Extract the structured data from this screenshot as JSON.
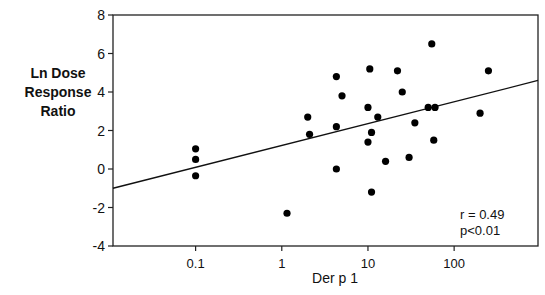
{
  "chart_data": {
    "type": "scatter",
    "title": "",
    "xlabel": "Der p 1",
    "ylabel": "Ln Dose Response Ratio",
    "ylabel_lines": [
      "Ln Dose",
      "Response",
      "Ratio"
    ],
    "xscale": "log",
    "xlim": [
      0.011,
      940
    ],
    "ylim": [
      -4,
      8
    ],
    "x_ticks": [
      0.1,
      1,
      10,
      100
    ],
    "x_tick_labels": [
      "0.1",
      "1",
      "10",
      "100"
    ],
    "y_ticks": [
      -4,
      -2,
      0,
      2,
      4,
      6,
      8
    ],
    "y_tick_labels": [
      "-4",
      "-2",
      "0",
      "2",
      "4",
      "6",
      "8"
    ],
    "grid": false,
    "legend": null,
    "points": [
      {
        "x": 0.1,
        "y": 1.05
      },
      {
        "x": 0.1,
        "y": 0.5
      },
      {
        "x": 0.1,
        "y": -0.35
      },
      {
        "x": 1.15,
        "y": -2.3
      },
      {
        "x": 2.0,
        "y": 2.7
      },
      {
        "x": 2.1,
        "y": 1.8
      },
      {
        "x": 4.3,
        "y": 4.8
      },
      {
        "x": 5.0,
        "y": 3.8
      },
      {
        "x": 4.3,
        "y": 2.2
      },
      {
        "x": 4.3,
        "y": 0.0
      },
      {
        "x": 10.5,
        "y": 5.2
      },
      {
        "x": 10.0,
        "y": 3.2
      },
      {
        "x": 11.0,
        "y": 1.9
      },
      {
        "x": 10.0,
        "y": 1.4
      },
      {
        "x": 11.0,
        "y": -1.2
      },
      {
        "x": 13.0,
        "y": 2.7
      },
      {
        "x": 16.0,
        "y": 0.4
      },
      {
        "x": 22.0,
        "y": 5.1
      },
      {
        "x": 25.0,
        "y": 4.0
      },
      {
        "x": 35.0,
        "y": 2.4
      },
      {
        "x": 30.0,
        "y": 0.6
      },
      {
        "x": 55.0,
        "y": 6.5
      },
      {
        "x": 50.0,
        "y": 3.2
      },
      {
        "x": 60.0,
        "y": 3.2
      },
      {
        "x": 58.0,
        "y": 1.5
      },
      {
        "x": 200.0,
        "y": 2.9
      },
      {
        "x": 250.0,
        "y": 5.1
      }
    ],
    "regression_line": {
      "x": [
        0.011,
        940
      ],
      "y": [
        -1.0,
        4.6
      ]
    },
    "annotations": [
      "r = 0.49",
      "p<0.01"
    ]
  },
  "labels": {
    "ylabel_line1": "Ln Dose",
    "ylabel_line2": "Response",
    "ylabel_line3": "Ratio",
    "xlabel": "Der p 1",
    "stat_r": "r = 0.49",
    "stat_p": "p<0.01"
  }
}
